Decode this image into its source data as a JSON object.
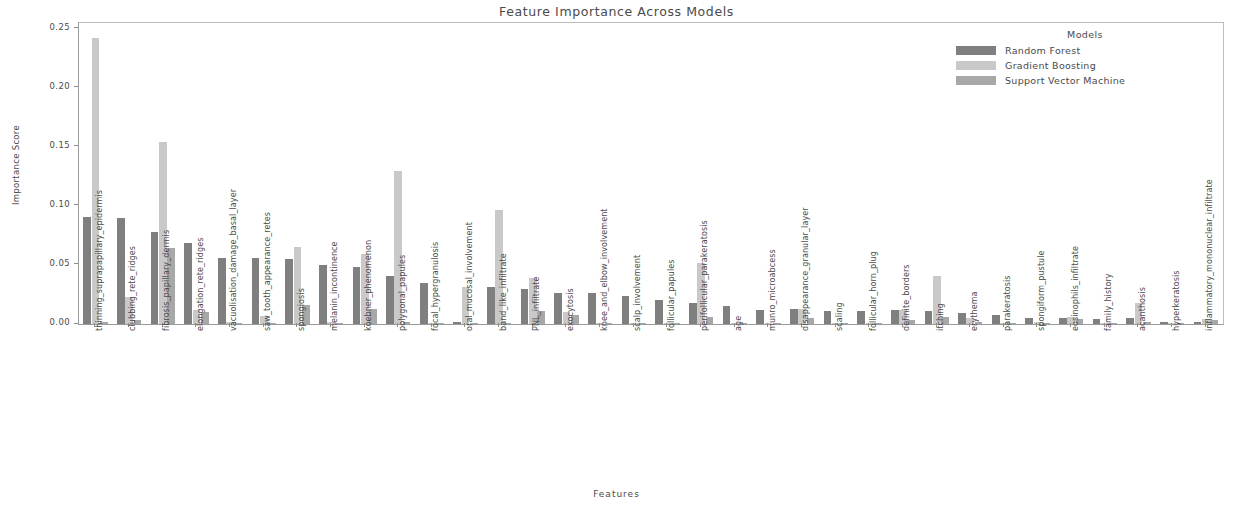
{
  "chart_data": {
    "type": "bar",
    "title": "Feature Importance Across Models",
    "xlabel": "Features",
    "ylabel": "Importance Score",
    "ylim": [
      0.0,
      0.255
    ],
    "yticks": [
      "0.00",
      "0.05",
      "0.10",
      "0.15",
      "0.20",
      "0.25"
    ],
    "ytick_values": [
      0.0,
      0.05,
      0.1,
      0.15,
      0.2,
      0.25
    ],
    "grid": false,
    "legend_title": "Models",
    "legend_position": "upper right",
    "colors": [
      "#7f7f7f",
      "#c9c9c9",
      "#a8a8a8"
    ],
    "categories": [
      "thinning_suprapapillary_epidermis",
      "clubbing_rete_ridges",
      "fibrosis_papillary_dermis",
      "elongation_rete_ridges",
      "vacuolisation_damage_basal_layer",
      "saw_tooth_appearance_retes",
      "spongiosis",
      "melanin_incontinence",
      "koebner_phenomenon",
      "polygonal_papules",
      "focal_hypergranulosis",
      "oral_mucosal_involvement",
      "band_like_infiltrate",
      "PNL_infiltrate",
      "exocytosis",
      "knee_and_elbow_involvement",
      "scalp_involvement",
      "follicular_papules",
      "perifollicular_parakeratosis",
      "age",
      "munro_microabcess",
      "disappearance_granular_layer",
      "scaling",
      "follicular_horn_plug",
      "definite_borders",
      "itching",
      "erythema",
      "parakeratosis",
      "spongiform_pustule",
      "eosinophils_infiltrate",
      "family_history",
      "acanthosis",
      "hyperkeratosis",
      "inflammatory_mononuclear_infiltrate"
    ],
    "series": [
      {
        "name": "Random Forest",
        "color": "#7f7f7f",
        "values": [
          0.091,
          0.09,
          0.078,
          0.069,
          0.056,
          0.056,
          0.055,
          0.05,
          0.048,
          0.041,
          0.035,
          0.002,
          0.031,
          0.03,
          0.026,
          0.026,
          0.024,
          0.02,
          0.018,
          0.015,
          0.012,
          0.013,
          0.011,
          0.011,
          0.012,
          0.011,
          0.009,
          0.008,
          0.005,
          0.005,
          0.004,
          0.005,
          0.002,
          0.002
        ]
      },
      {
        "name": "Gradient Boosting",
        "color": "#c9c9c9",
        "values": [
          0.242,
          0.023,
          0.154,
          0.012,
          0.002,
          0.007,
          0.065,
          0.002,
          0.059,
          0.13,
          0.001,
          0.031,
          0.097,
          0.039,
          0.01,
          0.001,
          0.001,
          0.001,
          0.052,
          0.001,
          0.001,
          0.013,
          0.001,
          0.001,
          0.012,
          0.041,
          0.005,
          0.001,
          0.002,
          0.006,
          0.001,
          0.018,
          0.001,
          0.004
        ]
      },
      {
        "name": "Support Vector Machine",
        "color": "#a8a8a8",
        "values": [
          0.002,
          0.003,
          0.064,
          0.01,
          0.001,
          0.001,
          0.016,
          0.001,
          0.013,
          0.002,
          0.001,
          0.001,
          0.001,
          0.011,
          0.008,
          0.001,
          0.001,
          0.001,
          0.006,
          0.001,
          0.001,
          0.005,
          0.001,
          0.001,
          0.003,
          0.006,
          0.002,
          0.001,
          0.001,
          0.004,
          0.001,
          0.002,
          0.001,
          0.003
        ]
      }
    ]
  }
}
